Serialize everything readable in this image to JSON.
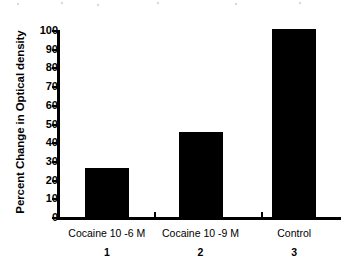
{
  "chart_data": {
    "type": "bar",
    "title": "",
    "subtitle": "",
    "xlabel": "",
    "ylabel": "Percent Change in Optical density",
    "categories": [
      "Cocaine 10 -6 M",
      "Cocaine 10 -9 M",
      "Control"
    ],
    "group_numbers": [
      "1",
      "2",
      "3"
    ],
    "values": [
      26.5,
      46,
      101
    ],
    "ylim": [
      0,
      100
    ],
    "ytick_labels": [
      "0",
      "10",
      "20",
      "30",
      "40",
      "50",
      "60",
      "70",
      "80",
      "90",
      "100"
    ],
    "ytick_values": [
      0,
      10,
      20,
      30,
      40,
      50,
      60,
      70,
      80,
      90,
      100
    ],
    "grid": false,
    "legend": false,
    "legend_position": "none",
    "bar_color": "#000000",
    "axis_color": "#000000",
    "background_color": "#ffffff"
  }
}
